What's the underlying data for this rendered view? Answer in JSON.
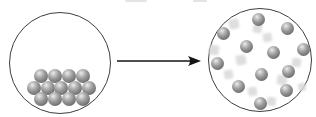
{
  "figure": {
    "kind": "particle-state-change-diagram",
    "left_circle": {
      "label": "solid-state-particles",
      "cx": 60,
      "cy": 63,
      "r": 51,
      "stroke_width": 1,
      "sphere_diameter": 14,
      "spheres": [
        {
          "x": 41,
          "y": 76
        },
        {
          "x": 55,
          "y": 76
        },
        {
          "x": 69,
          "y": 76
        },
        {
          "x": 83,
          "y": 76
        },
        {
          "x": 34,
          "y": 88
        },
        {
          "x": 48,
          "y": 88
        },
        {
          "x": 61,
          "y": 88
        },
        {
          "x": 75,
          "y": 88
        },
        {
          "x": 89,
          "y": 88
        },
        {
          "x": 41,
          "y": 99
        },
        {
          "x": 55,
          "y": 99
        },
        {
          "x": 69,
          "y": 99
        },
        {
          "x": 83,
          "y": 99
        }
      ]
    },
    "arrow": {
      "direction": "right",
      "x1": 117,
      "x2": 201,
      "y": 61,
      "head_length": 13,
      "head_width": 10,
      "stroke_width": 1.4
    },
    "right_circle": {
      "label": "gas-state-particles",
      "cx": 260,
      "cy": 60,
      "r": 52,
      "stroke_width": 1,
      "sphere_diameter": 13,
      "spheres": [
        {
          "x": 258,
          "y": 19
        },
        {
          "x": 287,
          "y": 28
        },
        {
          "x": 223,
          "y": 33
        },
        {
          "x": 246,
          "y": 46
        },
        {
          "x": 273,
          "y": 52
        },
        {
          "x": 303,
          "y": 49
        },
        {
          "x": 217,
          "y": 63
        },
        {
          "x": 261,
          "y": 74
        },
        {
          "x": 288,
          "y": 71
        },
        {
          "x": 238,
          "y": 86
        },
        {
          "x": 286,
          "y": 90
        },
        {
          "x": 260,
          "y": 103
        }
      ],
      "motion_ghosts": [
        {
          "x": 234,
          "y": 24,
          "s": 10
        },
        {
          "x": 257,
          "y": 28,
          "s": 9
        },
        {
          "x": 267,
          "y": 37,
          "s": 9
        },
        {
          "x": 214,
          "y": 50,
          "s": 10
        },
        {
          "x": 241,
          "y": 60,
          "s": 10
        },
        {
          "x": 296,
          "y": 62,
          "s": 9
        },
        {
          "x": 228,
          "y": 74,
          "s": 9
        },
        {
          "x": 282,
          "y": 80,
          "s": 10
        },
        {
          "x": 252,
          "y": 91,
          "s": 9
        },
        {
          "x": 271,
          "y": 101,
          "s": 9
        },
        {
          "x": 302,
          "y": 87,
          "s": 8
        }
      ]
    },
    "top_crop_artifacts": [
      {
        "x": 125,
        "y": 0,
        "w": 22,
        "h": 2
      },
      {
        "x": 193,
        "y": 0,
        "w": 14,
        "h": 2
      }
    ],
    "colors": {
      "background": "#ffffff",
      "circle_stroke": "#3f3f3f",
      "arrow": "#141414",
      "sphere_highlight": "#ededed",
      "sphere_light": "#c2c2c2",
      "sphere_body": "#949494",
      "sphere_mid": "#7c7c7c",
      "sphere_shadow": "#474747",
      "ghost": "#d9d9d9"
    }
  }
}
